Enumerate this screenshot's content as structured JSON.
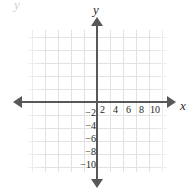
{
  "figure": {
    "kind": "cartesian-coordinate-plane",
    "artifact_text": "y",
    "axes": {
      "x_label": "x",
      "y_label": "y",
      "axis_color": "#58585a",
      "grid_color": "#e2e2e2",
      "label_color": "#231f20"
    }
  },
  "chart_data": {
    "type": "scatter",
    "title": "",
    "xlabel": "x",
    "ylabel": "y",
    "grid": true,
    "legend": null,
    "series": [],
    "x": [],
    "y": [],
    "xlim": [
      -10,
      12
    ],
    "ylim": [
      -11,
      11
    ],
    "x_tick_labels": [
      "2",
      "4",
      "6",
      "8",
      "10"
    ],
    "x_tick_values": [
      2,
      4,
      6,
      8,
      10
    ],
    "y_tick_labels": [
      "−2",
      "−4",
      "−6",
      "−8",
      "−10"
    ],
    "y_tick_values": [
      -2,
      -4,
      -6,
      -8,
      -10
    ],
    "tick_step": 2,
    "annotations": []
  },
  "ticks": {
    "x": [
      {
        "label": "2",
        "left": 100
      },
      {
        "label": "4",
        "left": 113
      },
      {
        "label": "6",
        "left": 126
      },
      {
        "label": "8",
        "left": 139
      },
      {
        "label": "10",
        "left": 150
      }
    ],
    "y": [
      {
        "label": "−2",
        "top": 108
      },
      {
        "label": "−4",
        "top": 121
      },
      {
        "label": "−6",
        "top": 134
      },
      {
        "label": "−8",
        "top": 147
      },
      {
        "label": "−10",
        "top": 160
      }
    ]
  }
}
